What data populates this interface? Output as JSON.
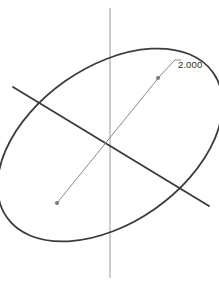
{
  "view": {
    "width": 219,
    "height": 282,
    "background_color": "#ffffff",
    "kind": "cad-sketch-viewport"
  },
  "colors": {
    "ellipse_stroke": "#3c3c3c",
    "major_axis_stroke": "#3a3a3a",
    "minor_axis_stroke": "#8a8a8a",
    "construction_axis_stroke": "#9a9a9a",
    "dimension_leader_stroke": "#8a8a8a",
    "dimension_text": "#2b2b2b",
    "endpoint_marker_fill": "#7d7d7d"
  },
  "sketch": {
    "ellipse": {
      "center_x": 110,
      "center_y": 145,
      "semi_major": 126,
      "semi_minor": 78,
      "rotation_deg": -35,
      "stroke_width": 1.8
    },
    "major_axis": {
      "x1": 13,
      "y1": 87,
      "x2": 209,
      "y2": 206,
      "stroke_width": 1.8
    },
    "minor_axis": {
      "x1": 57,
      "y1": 203,
      "x2": 160,
      "y2": 76,
      "stroke_width": 1.0
    },
    "vertical_construction_axis": {
      "x1": 110,
      "y1": 8,
      "x2": 110,
      "y2": 278,
      "stroke_width": 1.0
    },
    "endpoint_markers": [
      {
        "name": "minor-axis-lower-endpoint",
        "cx": 57,
        "cy": 203,
        "r": 1.7
      },
      {
        "name": "minor-axis-upper-endpoint",
        "cx": 158,
        "cy": 78,
        "r": 1.7
      }
    ]
  },
  "dimension": {
    "label": "2.000",
    "label_x": 178,
    "label_y": 68,
    "leader": {
      "x1": 160,
      "y1": 76,
      "x2": 175,
      "y2": 60
    },
    "leader_shelf": {
      "x1": 175,
      "y1": 60,
      "x2": 181,
      "y2": 60
    }
  }
}
